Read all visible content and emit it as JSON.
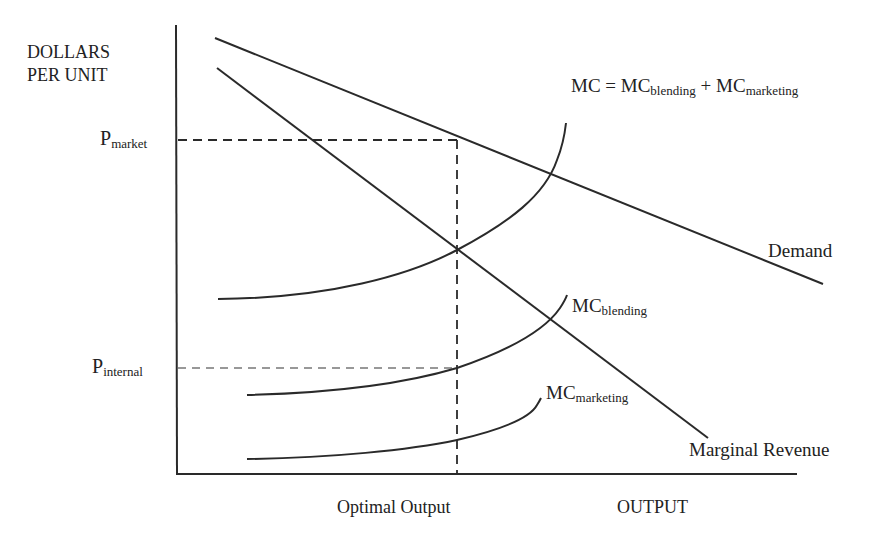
{
  "diagram": {
    "y_axis_label_line1": "DOLLARS",
    "y_axis_label_line2": "PER UNIT",
    "x_axis_label": "OUTPUT",
    "optimal_output_label": "Optimal Output",
    "p_market": {
      "base": "P",
      "sub": "market"
    },
    "p_internal": {
      "base": "P",
      "sub": "internal"
    },
    "mc_total": {
      "base1": "MC = MC",
      "sub1": "blending",
      "plus": " + MC",
      "sub2": "marketing"
    },
    "mc_blending": {
      "base": "MC",
      "sub": "blending"
    },
    "mc_marketing": {
      "base": "MC",
      "sub": "marketing"
    },
    "demand_label": "Demand",
    "mr_label": "Marginal Revenue",
    "line_color": "#2a2a2a",
    "curves": [
      {
        "name": "Demand",
        "type": "line",
        "from": [
          215,
          38
        ],
        "to": [
          823,
          284
        ]
      },
      {
        "name": "Marginal Revenue",
        "type": "line",
        "from": [
          217,
          68
        ],
        "to": [
          710,
          440
        ]
      },
      {
        "name": "MC",
        "type": "curve"
      },
      {
        "name": "MC blending",
        "type": "curve"
      },
      {
        "name": "MC marketing",
        "type": "curve"
      }
    ]
  }
}
